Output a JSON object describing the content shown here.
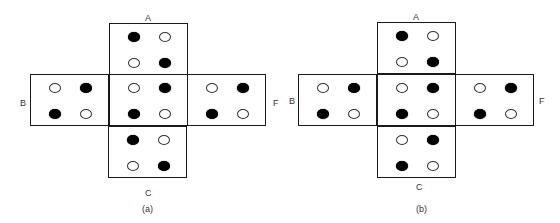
{
  "figures": [
    {
      "caption": "(a)",
      "labels": {
        "top": "A",
        "left": "B",
        "right": "F",
        "bottom": "C"
      },
      "faces": {
        "A": [
          [
            "black",
            "white"
          ],
          [
            "white",
            "black"
          ]
        ],
        "B": [
          [
            "white",
            "black"
          ],
          [
            "black",
            "white"
          ]
        ],
        "center": [
          [
            "white",
            "black"
          ],
          [
            "black",
            "white"
          ]
        ],
        "F": [
          [
            "white",
            "black"
          ],
          [
            "black",
            "white"
          ]
        ],
        "C": [
          [
            "black",
            "white"
          ],
          [
            "white",
            "black"
          ]
        ]
      }
    },
    {
      "caption": "(b)",
      "labels": {
        "top": "A",
        "left": "B",
        "right": "F",
        "bottom": "C"
      },
      "faces": {
        "A": [
          [
            "black",
            "white"
          ],
          [
            "white",
            "black"
          ]
        ],
        "B": [
          [
            "white",
            "black"
          ],
          [
            "black",
            "white"
          ]
        ],
        "center": [
          [
            "white",
            "black"
          ],
          [
            "black",
            "white"
          ]
        ],
        "F": [
          [
            "white",
            "black"
          ],
          [
            "black",
            "white"
          ]
        ],
        "C": [
          [
            "white",
            "black"
          ],
          [
            "black",
            "white"
          ]
        ]
      }
    }
  ],
  "colors": {
    "filled": "#000000",
    "hollow": "#ffffff",
    "outline": "#1a1a1a"
  }
}
